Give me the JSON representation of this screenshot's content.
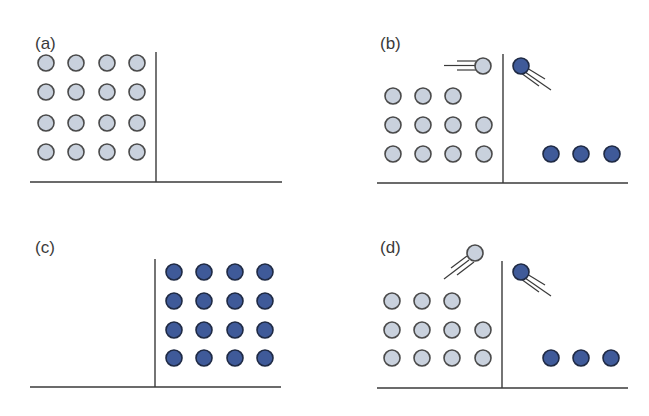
{
  "figure": {
    "colors": {
      "light_fill": "#c9d1dd",
      "light_stroke": "#4a4a4a",
      "dark_fill": "#3f5a99",
      "dark_stroke": "#1f2a44",
      "line": "#3a3a3a"
    },
    "panels": [
      {
        "id": "a",
        "label": "(a)",
        "description": "16 light particles in left compartment, right compartment empty"
      },
      {
        "id": "b",
        "label": "(b)",
        "description": "light particle moving toward partition, dark particle emerging on right; 3 dark particles at bottom right"
      },
      {
        "id": "c",
        "label": "(c)",
        "description": "all 16 particles dark and in right compartment, left compartment empty"
      },
      {
        "id": "d",
        "label": "(d)",
        "description": "light particle bouncing up-right, dark particle emerging on right; 3 dark particles at bottom right"
      }
    ]
  }
}
